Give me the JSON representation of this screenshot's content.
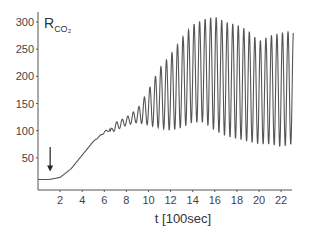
{
  "chart_data": {
    "type": "line",
    "title": "",
    "ylabel": "R_CO2",
    "ylabel_main": "R",
    "ylabel_sub": "CO₂",
    "xlabel": "t  [100sec]",
    "xlim": [
      0,
      23.5
    ],
    "ylim": [
      0,
      315
    ],
    "x_ticks": [
      2,
      4,
      6,
      8,
      10,
      12,
      14,
      16,
      18,
      20,
      22
    ],
    "y_ticks": [
      50,
      100,
      150,
      200,
      250,
      300
    ],
    "grid": false,
    "legend": null,
    "line_color": "#555555",
    "annotations": [
      {
        "type": "arrow-down",
        "x": 1.1,
        "y_from": 70,
        "y_to": 25,
        "label": ""
      }
    ],
    "series": [
      {
        "name": "R_CO2",
        "description": "Flat baseline ~10 until t~1.5, sigmoidal rise to ~110 by t~7, then oscillations (period ~0.5 units) with growing amplitude; upper envelope peaks ~310 around t~15-16, lower envelope minimum ~70-80 near t~20-23",
        "baseline_points": {
          "x": [
            0,
            1,
            2,
            3,
            4,
            5,
            6,
            7,
            8,
            9,
            10,
            11,
            12,
            13,
            14,
            15,
            16,
            17,
            18,
            19,
            20,
            21,
            22,
            23
          ],
          "y": [
            10,
            10,
            14,
            30,
            55,
            80,
            97,
            108,
            118,
            135,
            160,
            180,
            195,
            200,
            200,
            195,
            190,
            185,
            180,
            178,
            175,
            175,
            172,
            172
          ]
        },
        "upper_envelope": {
          "x": [
            6.5,
            7,
            8,
            9,
            10,
            11,
            12,
            13,
            14,
            15,
            16,
            17,
            18,
            19,
            20,
            21,
            22,
            23
          ],
          "y": [
            100,
            115,
            125,
            140,
            175,
            215,
            240,
            270,
            295,
            305,
            310,
            300,
            295,
            285,
            265,
            275,
            280,
            285
          ]
        },
        "lower_envelope": {
          "x": [
            6.5,
            7,
            8,
            9,
            10,
            11,
            12,
            13,
            14,
            15,
            16,
            17,
            18,
            19,
            20,
            21,
            22,
            23
          ],
          "y": [
            95,
            100,
            110,
            115,
            110,
            105,
            100,
            105,
            115,
            115,
            100,
            90,
            85,
            80,
            75,
            75,
            70,
            75
          ]
        },
        "oscillation_period": 0.5
      }
    ]
  }
}
